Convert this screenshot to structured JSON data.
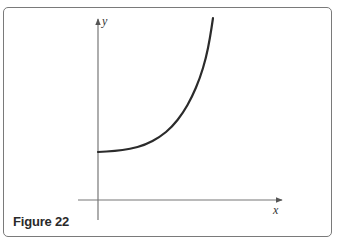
{
  "figure": {
    "label": "Figure 22",
    "border_color": "#7a7a7a"
  },
  "chart_data": {
    "type": "line",
    "title": "",
    "xlabel": "x",
    "ylabel": "y",
    "grid": false,
    "ticks": false,
    "series": [
      {
        "name": "curve",
        "color": "#2b2b2b",
        "points_px": [
          [
            98,
            152
          ],
          [
            115,
            151
          ],
          [
            130,
            149
          ],
          [
            145,
            145
          ],
          [
            160,
            137
          ],
          [
            172,
            127
          ],
          [
            183,
            113
          ],
          [
            192,
            97
          ],
          [
            200,
            78
          ],
          [
            206,
            58
          ],
          [
            210,
            38
          ],
          [
            213,
            18
          ]
        ]
      }
    ],
    "y_intercept": "positive (above x-axis)"
  }
}
